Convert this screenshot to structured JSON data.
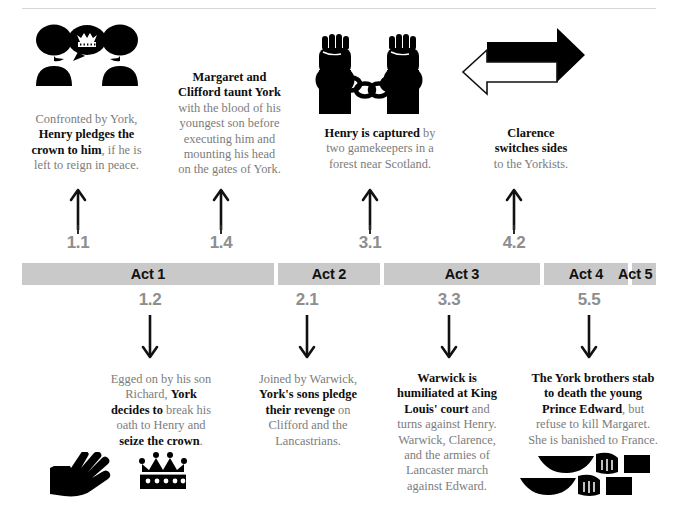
{
  "timeline": {
    "acts": [
      {
        "label": "Act 1",
        "left": 0,
        "width": 252
      },
      {
        "label": "Act 2",
        "left": 256,
        "width": 102
      },
      {
        "label": "Act 3",
        "left": 362,
        "width": 156
      },
      {
        "label": "Act 4",
        "left": 522,
        "width": 84
      },
      {
        "label": "Act 5",
        "left": 610,
        "width": 24
      }
    ],
    "bar_color": "#c9c9c9",
    "act_label_color": "#111111",
    "scene_number_color": "#8e8e8e"
  },
  "above": [
    {
      "scene": "1.1",
      "icon": "two-figures-crown-speech-icon",
      "text_html": "Confronted by York,<br><b>Henry pledges the</b><br><b>crown to him</b>, if he is<br>left to reign in peace.",
      "text_plain": "Confronted by York, Henry pledges the crown to him, if he is left to reign in peace."
    },
    {
      "scene": "1.4",
      "icon": "none",
      "text_html": "<b>Margaret and</b><br><b>Clifford taunt York</b><br>with the blood of his<br>youngest son before<br>executing him and<br>mounting his head<br>on the gates of York.",
      "text_plain": "Margaret and Clifford taunt York with the blood of his youngest son before executing him and mounting his head on the gates of York."
    },
    {
      "scene": "3.1",
      "icon": "handcuffed-fists-icon",
      "text_html": "<b>Henry is captured</b> by<br>two gamekeepers in a<br>forest near Scotland.",
      "text_plain": "Henry is captured by two gamekeepers in a forest near Scotland."
    },
    {
      "scene": "4.2",
      "icon": "switching-arrows-icon",
      "text_html": "<b>Clarence</b><br><b>switches sides</b><br>to the Yorkists.",
      "text_plain": "Clarence switches sides to the Yorkists."
    }
  ],
  "below": [
    {
      "scene": "1.2",
      "icon": "hand-and-crown-icon",
      "text_html": "Egged on by his son<br>Richard, <b>York</b><br><b>decides to</b> break his<br>oath to Henry and<br><b>seize the crown</b>.",
      "text_plain": "Egged on by his son Richard, York decides to break his oath to Henry and seize the crown."
    },
    {
      "scene": "2.1",
      "icon": "none",
      "text_html": "Joined by Warwick,<br><b>York's sons pledge</b><br><b>their revenge</b> on<br>Clifford and the<br>Lancastrians.",
      "text_plain": "Joined by Warwick, York's sons pledge their revenge on Clifford and the Lancastrians."
    },
    {
      "scene": "3.3",
      "icon": "none",
      "text_html": "<b>Warwick is</b><br><b>humiliated at King</b><br><b>Louis' court</b> and<br>turns against Henry.<br>Warwick, Clarence,<br>and the armies of<br>Lancaster march<br>against Edward.",
      "text_plain": "Warwick is humiliated at King Louis' court and turns against Henry. Warwick, Clarence, and the armies of Lancaster march against Edward."
    },
    {
      "scene": "5.5",
      "icon": "two-daggers-icon",
      "text_html": "<b>The York brothers stab</b><br><b>to death the young</b><br><b>Prince Edward</b>, but<br>refuse to kill Margaret.<br>She is banished to France.",
      "text_plain": "The York brothers stab to death the young Prince Edward, but refuse to kill Margaret. She is banished to France."
    }
  ]
}
